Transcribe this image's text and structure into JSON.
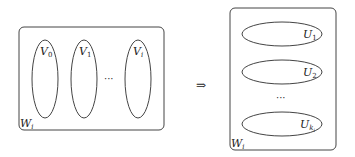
{
  "left_box": {
    "label": "W",
    "label_sub": "i",
    "sets": [
      {
        "label": "V",
        "sub": "0"
      },
      {
        "label": "V",
        "sub": "1"
      },
      {
        "label": "V",
        "sub": "i"
      }
    ],
    "ellipsis": "···"
  },
  "arrow": "⇒",
  "right_box": {
    "label": "W",
    "label_sub": "i",
    "sets": [
      {
        "label": "U",
        "sub": "1"
      },
      {
        "label": "U",
        "sub": "2"
      },
      {
        "label": "U",
        "sub": "k",
        "subsub": "i"
      }
    ],
    "ellipsis": "···"
  },
  "colors": {
    "stroke": "#444444",
    "text": "#222222",
    "background": "#ffffff"
  }
}
